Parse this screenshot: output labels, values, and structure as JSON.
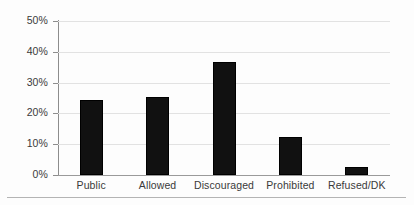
{
  "chart_data": {
    "type": "bar",
    "title": "",
    "subtitle": "",
    "xlabel": "",
    "ylabel": "",
    "categories": [
      "Public",
      "Allowed",
      "Discouraged",
      "Prohibited",
      "Refused/DK"
    ],
    "values": [
      24.2,
      25.3,
      36.8,
      12.5,
      2.5
    ],
    "series": [
      {
        "name": "",
        "values": [
          24.2,
          25.3,
          36.8,
          12.5,
          2.5
        ]
      }
    ],
    "ylim": [
      0,
      50
    ],
    "ytick_values": [
      0,
      10,
      20,
      30,
      40,
      50
    ],
    "ytick_labels": [
      "0%",
      "10%",
      "20%",
      "30%",
      "40%",
      "50%"
    ],
    "grid": true,
    "grid_axis": "y",
    "legend": false,
    "legend_position": "none",
    "bar_color": "#111111",
    "grid_color": "#e2e2e2",
    "axis_color": "#8d8d8d",
    "text_color": "#3a3a3a",
    "background_color": "#fdfdfd",
    "annotations": []
  }
}
